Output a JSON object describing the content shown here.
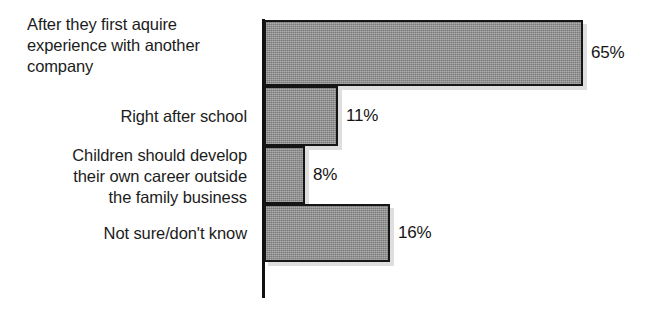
{
  "chart_data": {
    "type": "bar",
    "orientation": "horizontal",
    "title": "",
    "subtitle": "",
    "xlabel": "",
    "ylabel": "",
    "xlim": [
      0,
      70
    ],
    "grid": false,
    "legend": false,
    "value_suffix": "%",
    "categories": [
      "After they first aquire\nexperience with another\ncompany",
      "Right after school",
      "Children should develop\ntheir own career outside\nthe family business",
      "Not sure/don't know"
    ],
    "values": [
      65,
      11,
      8,
      16
    ],
    "value_labels": [
      "65%",
      "11%",
      "8%",
      "16%"
    ],
    "colors": {
      "bar_fill": "#8d8d8d",
      "bar_border": "#151515",
      "axis": "#111111",
      "text": "#1c1c1c",
      "background": "#ffffff"
    }
  },
  "bars": [
    {
      "label": "After they first aquire\nexperience with another\ncompany",
      "value_label": "65%",
      "value": 65,
      "label_align": "left",
      "geom": {
        "top": 20,
        "height": 66,
        "width": 319,
        "label_top": 14
      }
    },
    {
      "label": "Right after school",
      "value_label": "11%",
      "value": 11,
      "label_align": "right",
      "geom": {
        "top": 86,
        "height": 60,
        "width": 74,
        "label_top": 106
      }
    },
    {
      "label": "Children should develop\ntheir own career outside\nthe family business",
      "value_label": "8%",
      "value": 8,
      "label_align": "right",
      "geom": {
        "top": 146,
        "height": 58,
        "width": 41,
        "label_top": 145
      }
    },
    {
      "label": "Not sure/don't know",
      "value_label": "16%",
      "value": 16,
      "label_align": "right",
      "geom": {
        "top": 204,
        "height": 58,
        "width": 126,
        "label_top": 223
      }
    }
  ]
}
